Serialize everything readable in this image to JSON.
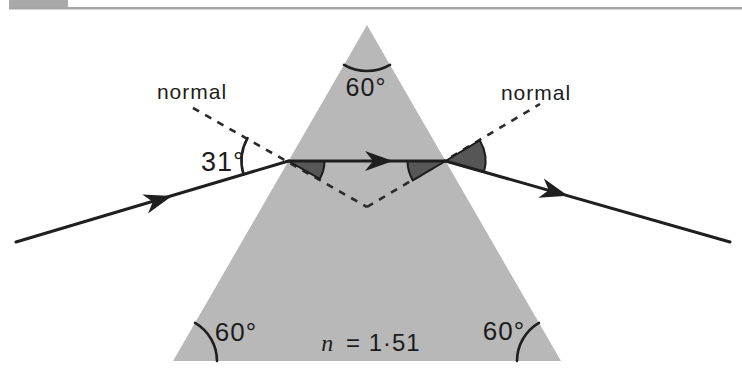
{
  "figure": {
    "type": "prism-refraction-ray-diagram",
    "labels": {
      "normal_left": "normal",
      "normal_right": "normal",
      "angle_incidence": "31°",
      "angle_apex": "60°",
      "angle_base_left": "60°",
      "angle_base_right": "60°",
      "index_symbol": "n",
      "index_value": "= 1·51"
    },
    "colors": {
      "prism_fill": "#b8b8b8",
      "shaded_angle_fill": "#565656",
      "line_color": "#1f1f1f",
      "header_block": "#a9a9a9",
      "header_rule": "#a6a6a6"
    }
  }
}
